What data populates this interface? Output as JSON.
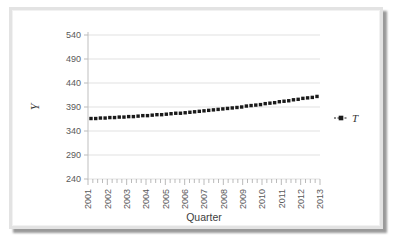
{
  "chart_data": {
    "type": "scatter",
    "title": "",
    "xlabel": "Quarter",
    "ylabel": "Y",
    "ylim": [
      240,
      540
    ],
    "yticks": [
      240,
      290,
      340,
      390,
      440,
      490,
      540
    ],
    "xticks": [
      "2001",
      "2002",
      "2003",
      "2004",
      "2005",
      "2006",
      "2007",
      "2008",
      "2009",
      "2010",
      "2011",
      "2012",
      "2013"
    ],
    "xtick_minor_per_major": 4,
    "grid": true,
    "legend_position": "right",
    "series": [
      {
        "name": "T",
        "marker": "square",
        "color": "#1a1a1a",
        "x": [
          "2001 Q1",
          "2001 Q2",
          "2001 Q3",
          "2001 Q4",
          "2002 Q1",
          "2002 Q2",
          "2002 Q3",
          "2002 Q4",
          "2003 Q1",
          "2003 Q2",
          "2003 Q3",
          "2003 Q4",
          "2004 Q1",
          "2004 Q2",
          "2004 Q3",
          "2004 Q4",
          "2005 Q1",
          "2005 Q2",
          "2005 Q3",
          "2005 Q4",
          "2006 Q1",
          "2006 Q2",
          "2006 Q3",
          "2006 Q4",
          "2007 Q1",
          "2007 Q2",
          "2007 Q3",
          "2007 Q4",
          "2008 Q1",
          "2008 Q2",
          "2008 Q3",
          "2008 Q4",
          "2009 Q1",
          "2009 Q2",
          "2009 Q3",
          "2009 Q4",
          "2010 Q1",
          "2010 Q2",
          "2010 Q3",
          "2010 Q4",
          "2011 Q1",
          "2011 Q2",
          "2011 Q3",
          "2011 Q4",
          "2012 Q1",
          "2012 Q2",
          "2012 Q3",
          "2012 Q4",
          "2013 Q1"
        ],
        "values": [
          366,
          366,
          367,
          367,
          368,
          368,
          369,
          369,
          370,
          370,
          371,
          372,
          372,
          373,
          374,
          374,
          375,
          376,
          377,
          377,
          378,
          379,
          380,
          381,
          382,
          383,
          384,
          385,
          386,
          387,
          388,
          389,
          390,
          392,
          393,
          394,
          395,
          397,
          398,
          399,
          401,
          402,
          403,
          405,
          406,
          408,
          409,
          410,
          412
        ]
      }
    ]
  },
  "legend": {
    "entries": [
      {
        "label": "T"
      }
    ]
  },
  "axes": {
    "y_title": "Y",
    "x_title": "Quarter"
  }
}
